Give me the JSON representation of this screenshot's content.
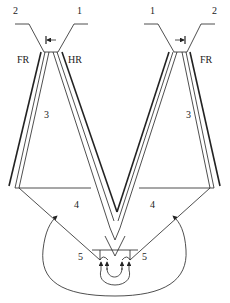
{
  "labels": {
    "left_port_2": "2",
    "left_port_1": "1",
    "right_port_1": "1",
    "right_port_2": "2",
    "left_fr": "FR",
    "left_hr": "HR",
    "right_fr": "FR",
    "left_region_3": "3",
    "right_region_3": "3",
    "left_region_4": "4",
    "right_region_4": "4",
    "left_region_5": "5",
    "right_region_5": "5"
  },
  "colors": {
    "stroke": "#222222",
    "background": "#ffffff"
  }
}
